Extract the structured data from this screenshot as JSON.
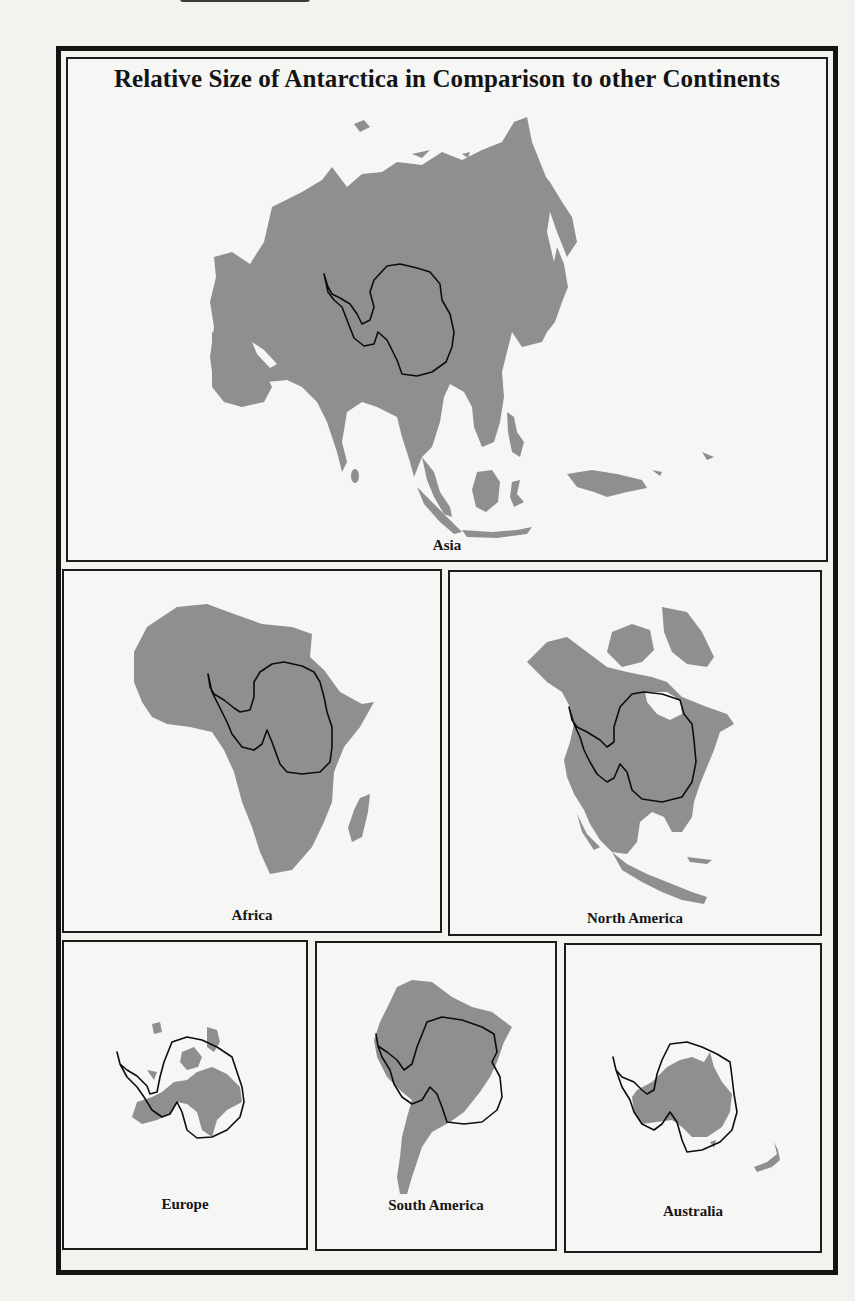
{
  "figure": {
    "title": "Relative Size of Antarctica in Comparison to other Continents",
    "overlay_outline": "Antarctica",
    "colors": {
      "land_fill": "#8f8f8f",
      "outline": "#0d0d0d",
      "background": "#f6f6f4",
      "frame": "#141414"
    }
  },
  "panels": [
    {
      "id": "asia",
      "label": "Asia"
    },
    {
      "id": "africa",
      "label": "Africa"
    },
    {
      "id": "north_america",
      "label": "North America"
    },
    {
      "id": "europe",
      "label": "Europe"
    },
    {
      "id": "south_america",
      "label": "South America"
    },
    {
      "id": "australia",
      "label": "Australia"
    }
  ]
}
